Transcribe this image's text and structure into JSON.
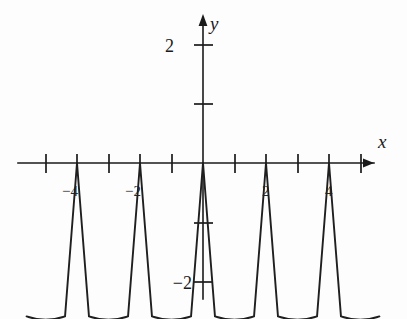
{
  "figure": {
    "background_color": "#fdfdfd",
    "ink_color": "#1a1a1a"
  },
  "chart_data": {
    "type": "line",
    "title": "",
    "subtitle": "",
    "xlabel": "x",
    "ylabel": "y",
    "grid": false,
    "legend": null,
    "xlim": [
      -5.6,
      5.6
    ],
    "ylim": [
      -2.9,
      2.4
    ],
    "x_ticks": [
      -5,
      -4,
      -3,
      -2,
      -1,
      1,
      2,
      3,
      4,
      5
    ],
    "x_tick_labels": [
      {
        "value": -4,
        "label": "−4"
      },
      {
        "value": -2,
        "label": "−2"
      },
      {
        "value": 2,
        "label": "2"
      },
      {
        "value": 4,
        "label": "4"
      }
    ],
    "y_ticks": [
      -2,
      -1,
      1,
      2
    ],
    "y_tick_labels": [
      {
        "value": 2,
        "label": "2"
      },
      {
        "value": -2,
        "label": "−2"
      }
    ],
    "period": 2,
    "cusp_x_values": [
      -4,
      -2,
      0,
      2,
      4
    ],
    "cusp_y_value": 0,
    "hump_center_x_values": [
      -5,
      -3,
      -1,
      1,
      3,
      5
    ],
    "hump_min_y_value": -2.35,
    "hump_shoulder_y_value": -2.6,
    "series": [
      {
        "name": "curve",
        "x": [
          -5.6,
          -5.3,
          -5.0,
          -4.7,
          -4.45,
          -4.2,
          -4.0,
          -3.8,
          -3.55,
          -3.3,
          -3.0,
          -2.7,
          -2.45,
          -2.2,
          -2.0,
          -1.8,
          -1.55,
          -1.3,
          -1.0,
          -0.7,
          -0.45,
          -0.2,
          0.0,
          0.2,
          0.45,
          0.7,
          1.0,
          1.3,
          1.55,
          1.8,
          2.0,
          2.2,
          2.45,
          2.7,
          3.0,
          3.3,
          3.55,
          3.8,
          4.0,
          4.2,
          4.45,
          4.7,
          5.0,
          5.3,
          5.6
        ],
        "y": [
          -2.62,
          -2.45,
          -2.35,
          -2.45,
          -2.62,
          -1.4,
          0.0,
          -1.4,
          -2.62,
          -2.45,
          -2.35,
          -2.45,
          -2.62,
          -1.4,
          0.0,
          -1.4,
          -2.62,
          -2.45,
          -2.35,
          -2.45,
          -2.62,
          -1.4,
          0.0,
          -1.4,
          -2.62,
          -2.45,
          -2.35,
          -2.45,
          -2.62,
          -1.4,
          0.0,
          -1.4,
          -2.62,
          -2.45,
          -2.35,
          -2.45,
          -2.62,
          -1.4,
          0.0,
          -1.4,
          -2.62,
          -2.45,
          -2.35,
          -2.45,
          -2.62
        ]
      }
    ]
  },
  "labels": {
    "x_axis": "x",
    "y_axis": "y",
    "y_top": "2",
    "y_bottom": "−2",
    "x_neg4": "−4",
    "x_neg2": "−2",
    "x_pos2": "2",
    "x_pos4": "4"
  }
}
